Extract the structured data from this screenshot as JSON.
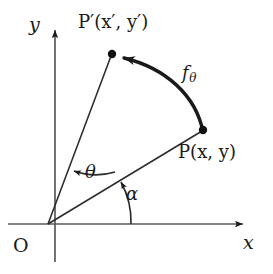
{
  "figure": {
    "background_color": "#ffffff",
    "stroke_color": "#1a1a1a",
    "width": 273,
    "height": 274
  },
  "axes": {
    "x_label": "x",
    "y_label": "y",
    "origin_label": "O",
    "x_axis_name": "x-axis",
    "y_axis_name": "y-axis"
  },
  "points": [
    {
      "id": "P",
      "label": "P(x, y)",
      "label_plain": "P(x,y)",
      "x": 203,
      "y": 130
    },
    {
      "id": "Pprime",
      "label": "P′(x′, y′)",
      "label_plain": "P'(x',y')",
      "x": 112,
      "y": 54
    },
    {
      "id": "O",
      "label": "O",
      "label_plain": "O",
      "x": 48,
      "y": 224
    }
  ],
  "angles": [
    {
      "id": "alpha",
      "label": "α",
      "label_plain": "alpha",
      "description": "angle from positive x-axis to ray OP"
    },
    {
      "id": "theta",
      "label": "θ",
      "label_plain": "theta",
      "description": "rotation angle from ray OP to ray OP-prime"
    }
  ],
  "map": {
    "label_base": "f",
    "label_subscript": "θ",
    "label_plain": "f_theta",
    "description": "curved arrow from P to P-prime representing the rotation map"
  }
}
